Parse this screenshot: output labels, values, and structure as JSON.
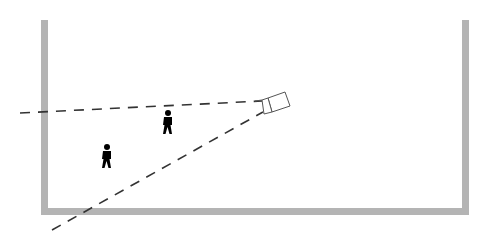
{
  "diagram": {
    "title": "",
    "colors": {
      "wall": "#b4b4b4",
      "line": "#333333",
      "person": "#000000",
      "camera": "#555555",
      "background": "#ffffff"
    },
    "room": {
      "left_wall": {
        "x": 41,
        "y": 20,
        "width": 7,
        "height": 195
      },
      "right_wall": {
        "x": 462,
        "y": 20,
        "width": 7,
        "height": 195
      },
      "floor": {
        "x": 41,
        "y": 208,
        "width": 428,
        "height": 7
      }
    },
    "camera": {
      "x": 262,
      "y": 100,
      "icon": "security-camera-icon"
    },
    "view_lines": [
      {
        "name": "upper-boundary",
        "x1": 20,
        "y1": 113,
        "x2": 262,
        "y2": 101
      },
      {
        "name": "lower-boundary",
        "x1": 52,
        "y1": 230,
        "x2": 263,
        "y2": 112
      }
    ],
    "people": [
      {
        "name": "person-1",
        "x": 168,
        "y": 120,
        "icon": "person-icon"
      },
      {
        "name": "person-2",
        "x": 107,
        "y": 155,
        "icon": "person-icon"
      }
    ]
  }
}
